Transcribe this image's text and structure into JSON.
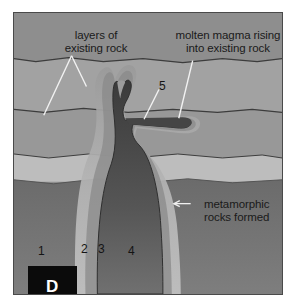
{
  "figure": {
    "panel_letter": "D",
    "title_absent": true,
    "background_color": "#ffffff",
    "border_color": "#4a4a4a"
  },
  "labels": {
    "layers_existing_rock": "layers of\nexisting rock",
    "molten_magma": "molten magma rising\ninto existing rock",
    "metamorphic": "metamorphic\nrocks formed",
    "callout_five": "5"
  },
  "numbers": [
    {
      "value": "1",
      "x": 37,
      "y": 243
    },
    {
      "value": "2",
      "x": 80,
      "y": 241
    },
    {
      "value": "3",
      "x": 97,
      "y": 241
    },
    {
      "value": "4",
      "x": 127,
      "y": 243
    }
  ],
  "colors": {
    "layer_1_top": "#8e8e8e",
    "layer_2": "#a2a2a2",
    "layer_3": "#999999",
    "layer_4_light_band": "#bdbdbd",
    "layer_5_bottom": "#6e6e6e",
    "magma_dark": "#4a4a4a",
    "magma_core": "#414141",
    "aureole_halo": "#b4b4b4",
    "aureole_dark_halo": "#7d7d7d",
    "boundary_line": "#3c3c3c",
    "leader_line": "#f2f2f2",
    "panel_box": "#0b0b0b",
    "panel_text": "#ffffff",
    "label_text": "#1a1a1a"
  },
  "geology": {
    "type": "cross-section",
    "feature": "igneous intrusion with contact metamorphic aureole",
    "strata_count": 5,
    "intrusion_parts": [
      "pluton",
      "neck",
      "forked dikes",
      "sill"
    ]
  }
}
